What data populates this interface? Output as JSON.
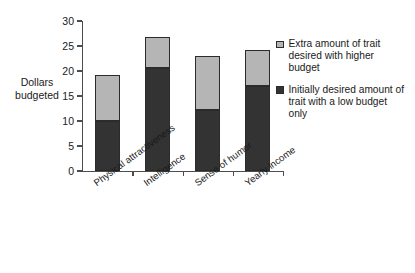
{
  "chart_data": {
    "type": "bar",
    "subtype": "stacked-bar",
    "title": "",
    "xlabel": "",
    "ylabel": "Dollars budgeted",
    "ylim": [
      0,
      30
    ],
    "yticks": [
      0,
      5,
      10,
      15,
      20,
      25,
      30
    ],
    "grid": false,
    "legend_position": "right",
    "categories": [
      "Physical attractiveness",
      "Intelligence",
      "Sense of humor",
      "Yearly income"
    ],
    "series": [
      {
        "name": "Initially desired amount of trait with a low budget only",
        "color": "#333333",
        "values": [
          10.0,
          20.6,
          12.2,
          17.0
        ]
      },
      {
        "name": "Extra amount of trait desired with higher budget",
        "color": "#b5b5b5",
        "values": [
          9.2,
          6.2,
          10.8,
          7.2
        ]
      }
    ],
    "totals": [
      19.2,
      26.8,
      23.0,
      24.2
    ]
  },
  "axis": {
    "y_label_line1": "Dollars",
    "y_label_line2": "budgeted",
    "y_tick_labels": [
      "0",
      "5",
      "10",
      "15",
      "20",
      "25",
      "30"
    ]
  },
  "legend": {
    "items": [
      {
        "swatch": "light-gray-square",
        "label": "Extra amount of trait desired with higher budget",
        "color": "#b5b5b5"
      },
      {
        "swatch": "dark-gray-square",
        "label": "Initially desired amount of trait with a low budget only",
        "color": "#333333"
      }
    ]
  }
}
